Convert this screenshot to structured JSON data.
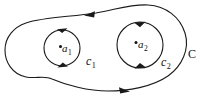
{
  "figure": {
    "background_color": "#ffffff",
    "stroke_color": "#1a1a1a",
    "labels": {
      "outer_contour": {
        "text": "C",
        "subscript": ""
      },
      "inner_contour_left": {
        "text": "c",
        "subscript": "1"
      },
      "inner_contour_right": {
        "text": "c",
        "subscript": "2"
      },
      "pole_left": {
        "text": "a",
        "subscript": "1"
      },
      "pole_right": {
        "text": "a",
        "subscript": "2"
      }
    },
    "orientations": {
      "outer_contour": "counterclockwise",
      "inner_contour_left": "counterclockwise",
      "inner_contour_right": "counterclockwise"
    },
    "arrow_count": 6
  }
}
